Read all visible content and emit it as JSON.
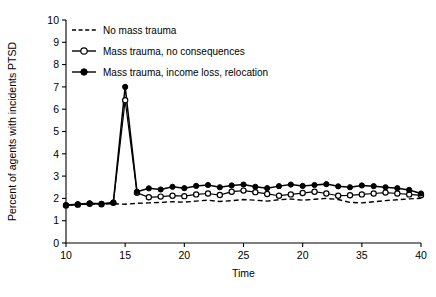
{
  "chart_data": {
    "type": "line",
    "title": "",
    "xlabel": "Time",
    "ylabel": "Percent of agents with incidents PTSD",
    "xlim": [
      10,
      40
    ],
    "ylim": [
      0,
      10
    ],
    "grid": false,
    "legend_position": "top-left",
    "x_tick_values": [
      10,
      15,
      20,
      25,
      30,
      35,
      40
    ],
    "x_tick_labels": [
      "10",
      "15",
      "20",
      "25",
      "20",
      "35",
      "40"
    ],
    "y_tick_values": [
      0,
      1,
      2,
      3,
      4,
      5,
      6,
      7,
      8,
      9,
      10
    ],
    "y_tick_labels": [
      "0",
      "1",
      "2",
      "3",
      "4",
      "5",
      "6",
      "7",
      "8",
      "9",
      "10"
    ],
    "x": [
      10,
      11,
      12,
      13,
      14,
      15,
      16,
      17,
      18,
      19,
      20,
      21,
      22,
      23,
      24,
      25,
      26,
      27,
      28,
      29,
      30,
      31,
      32,
      33,
      34,
      35,
      36,
      37,
      38,
      39,
      40
    ],
    "series": [
      {
        "name": "No mass trauma",
        "marker": "none",
        "linestyle": "dashed",
        "values": [
          1.7,
          1.72,
          1.75,
          1.73,
          1.76,
          1.74,
          1.78,
          1.8,
          1.82,
          1.85,
          1.83,
          1.88,
          1.92,
          1.86,
          1.9,
          1.95,
          1.92,
          1.88,
          1.94,
          1.97,
          1.92,
          1.96,
          2.0,
          1.95,
          1.82,
          1.8,
          1.85,
          1.9,
          1.94,
          1.98,
          2.0
        ]
      },
      {
        "name": "Mass trauma, no consequences",
        "marker": "open-circle",
        "linestyle": "solid",
        "values": [
          1.68,
          1.72,
          1.76,
          1.74,
          1.8,
          6.4,
          2.25,
          2.05,
          2.08,
          2.12,
          2.1,
          2.18,
          2.22,
          2.15,
          2.3,
          2.35,
          2.28,
          2.2,
          2.12,
          2.18,
          2.24,
          2.3,
          2.22,
          2.12,
          2.14,
          2.18,
          2.22,
          2.26,
          2.22,
          2.18,
          2.14
        ]
      },
      {
        "name": "Mass trauma, income loss, relocation",
        "marker": "filled-circle",
        "linestyle": "solid",
        "values": [
          1.7,
          1.74,
          1.78,
          1.76,
          1.82,
          7.0,
          2.3,
          2.45,
          2.4,
          2.52,
          2.46,
          2.56,
          2.6,
          2.5,
          2.58,
          2.62,
          2.52,
          2.46,
          2.55,
          2.62,
          2.56,
          2.6,
          2.64,
          2.54,
          2.5,
          2.58,
          2.55,
          2.5,
          2.46,
          2.38,
          2.22
        ]
      }
    ]
  },
  "legend": {
    "items": [
      {
        "label": "No mass trauma"
      },
      {
        "label": "Mass trauma, no consequences"
      },
      {
        "label": "Mass trauma, income loss, relocation"
      }
    ]
  }
}
